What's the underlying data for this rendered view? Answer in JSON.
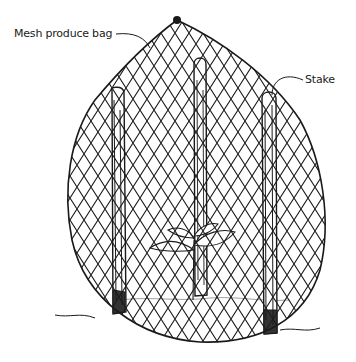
{
  "illustration": {
    "subject": "Plant protected by mesh produce bag supported by stakes",
    "labels": {
      "bag": "Mesh produce bag",
      "stake": "Stake"
    },
    "colors": {
      "ink": "#1a1a1a",
      "background": "#ffffff"
    }
  }
}
